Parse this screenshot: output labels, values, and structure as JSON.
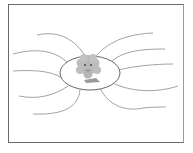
{
  "diagram": {
    "type": "mind-map",
    "center": {
      "shape": "ellipse",
      "icon": "cartoon-cloud-character-icon"
    },
    "branch_count": 10,
    "branches": {
      "left": 5,
      "right": 5
    },
    "colors": {
      "frame": "#6a6a6a",
      "branch": "#8a8a8a",
      "ellipse": "#555555",
      "character": "#b5b5b5"
    }
  }
}
